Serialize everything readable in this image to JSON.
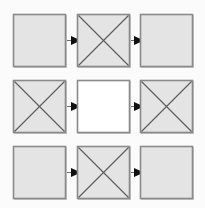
{
  "diagram": {
    "canvas": {
      "width": 205,
      "height": 208,
      "background": "#fbfbfb"
    },
    "style": {
      "fill_shaded": "#e4e4e4",
      "fill_empty": "#ffffff",
      "border_color": "#8a8a8a",
      "border_highlight": "#c9c9c9",
      "diagonal_color": "#5a5a5a",
      "arrow_line_color": "#6e6e6e",
      "arrow_head_color": "#101010",
      "border_width": 1.6,
      "diagonal_width": 1.1,
      "arrow_line_width": 1.3
    },
    "box_size": 52,
    "columns": [
      {
        "name": "column-left",
        "x": 13
      },
      {
        "name": "column-middle",
        "x": 77
      },
      {
        "name": "column-right",
        "x": 140
      }
    ],
    "rows": [
      {
        "name": "row-top",
        "y": 14
      },
      {
        "name": "row-middle",
        "y": 80
      },
      {
        "name": "row-bottom",
        "y": 146
      }
    ],
    "nodes": [
      {
        "id": "r1c1",
        "row": 0,
        "col": 0,
        "label": "plain-square",
        "fill": "shaded",
        "crossed": false
      },
      {
        "id": "r1c2",
        "row": 0,
        "col": 1,
        "label": "crossed-square",
        "fill": "shaded",
        "crossed": true
      },
      {
        "id": "r1c3",
        "row": 0,
        "col": 2,
        "label": "plain-square",
        "fill": "shaded",
        "crossed": false
      },
      {
        "id": "r2c1",
        "row": 1,
        "col": 0,
        "label": "crossed-square",
        "fill": "shaded",
        "crossed": true
      },
      {
        "id": "r2c2",
        "row": 1,
        "col": 1,
        "label": "empty-square",
        "fill": "empty",
        "crossed": false
      },
      {
        "id": "r2c3",
        "row": 1,
        "col": 2,
        "label": "crossed-square",
        "fill": "shaded",
        "crossed": true
      },
      {
        "id": "r3c1",
        "row": 2,
        "col": 0,
        "label": "plain-square",
        "fill": "shaded",
        "crossed": false
      },
      {
        "id": "r3c2",
        "row": 2,
        "col": 1,
        "label": "crossed-square",
        "fill": "shaded",
        "crossed": true
      },
      {
        "id": "r3c3",
        "row": 2,
        "col": 2,
        "label": "plain-square",
        "fill": "shaded",
        "crossed": false
      }
    ],
    "arrows": [
      {
        "id": "a1",
        "from": "r1c1",
        "to": "r1c2",
        "direction": "right"
      },
      {
        "id": "a2",
        "from": "r1c2",
        "to": "r1c3",
        "direction": "right"
      },
      {
        "id": "a3",
        "from": "r2c1",
        "to": "r2c2",
        "direction": "right"
      },
      {
        "id": "a4",
        "from": "r2c2",
        "to": "r2c3",
        "direction": "right"
      },
      {
        "id": "a5",
        "from": "r3c1",
        "to": "r3c2",
        "direction": "right"
      },
      {
        "id": "a6",
        "from": "r3c2",
        "to": "r3c3",
        "direction": "right"
      }
    ]
  }
}
